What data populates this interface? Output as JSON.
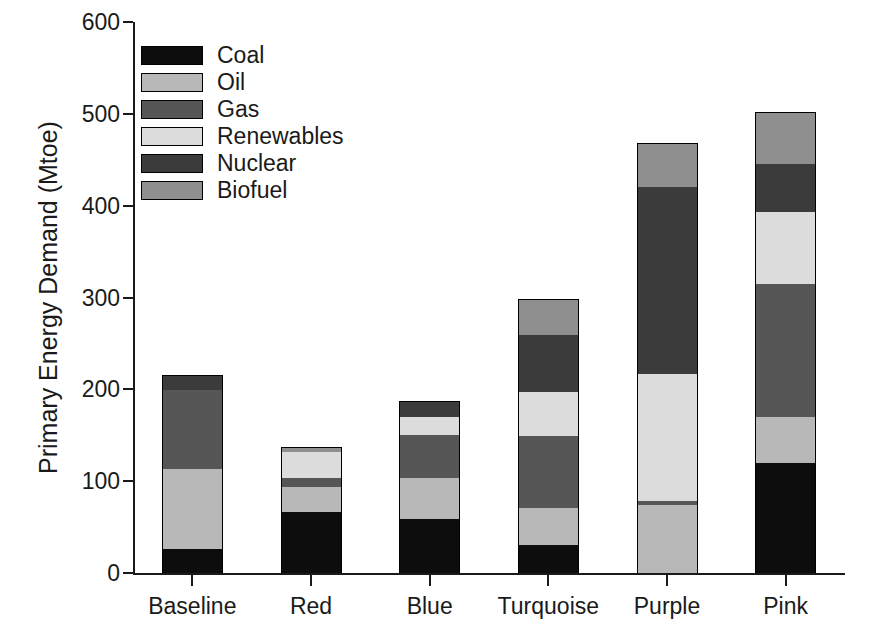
{
  "chart_data": {
    "type": "bar",
    "stacked": true,
    "title": "",
    "xlabel": "",
    "ylabel": "Primary Energy Demand (Mtoe)",
    "ylim": [
      0,
      600
    ],
    "yticks": [
      0,
      100,
      200,
      300,
      400,
      500,
      600
    ],
    "ytick_labels": [
      "0",
      "100",
      "200",
      "300",
      "400",
      "500",
      "600"
    ],
    "grid": false,
    "legend_position": "upper-left",
    "categories": [
      "Baseline",
      "Red",
      "Blue",
      "Turquoise",
      "Purple",
      "Pink"
    ],
    "series": [
      {
        "name": "Coal",
        "color": "#0d0d0d",
        "values": [
          26,
          66,
          59,
          31,
          0,
          120
        ]
      },
      {
        "name": "Oil",
        "color": "#b8b8b8",
        "values": [
          87,
          28,
          44,
          40,
          74,
          50
        ]
      },
      {
        "name": "Gas",
        "color": "#565656",
        "values": [
          86,
          10,
          47,
          78,
          4,
          145
        ]
      },
      {
        "name": "Renewables",
        "color": "#dcdcdc",
        "values": [
          0,
          28,
          20,
          48,
          139,
          78
        ]
      },
      {
        "name": "Nuclear",
        "color": "#3b3b3b",
        "values": [
          17,
          0,
          17,
          62,
          203,
          52
        ]
      },
      {
        "name": "Biofuel",
        "color": "#8f8f8f",
        "values": [
          0,
          5,
          0,
          39,
          48,
          57
        ]
      }
    ],
    "totals": [
      216,
      137,
      187,
      298,
      468,
      502
    ],
    "legend_entries": [
      "Coal",
      "Oil",
      "Gas",
      "Renewables",
      "Nuclear",
      "Biofuel"
    ],
    "units": "Mtoe"
  }
}
